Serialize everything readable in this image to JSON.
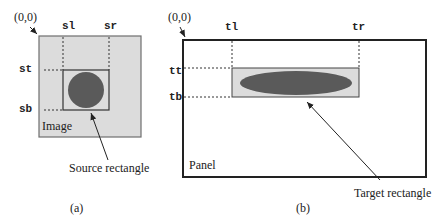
{
  "panel_a": {
    "origin_label": "(0,0)",
    "left_label": "sl",
    "right_label": "sr",
    "top_label": "st",
    "bottom_label": "sb",
    "container_label": "Image",
    "rect_caption": "Source rectangle",
    "subfigure_label": "(a)",
    "shape": "circle"
  },
  "panel_b": {
    "origin_label": "(0,0)",
    "left_label": "tl",
    "right_label": "tr",
    "top_label": "tt",
    "bottom_label": "tb",
    "container_label": "Panel",
    "rect_caption": "Target rectangle",
    "subfigure_label": "(b)",
    "shape": "ellipse"
  },
  "colors": {
    "image_fill": "#dcdcdc",
    "shape_fill": "#5a5a5a",
    "line": "#222222",
    "border_gray": "#6e6e6e"
  }
}
